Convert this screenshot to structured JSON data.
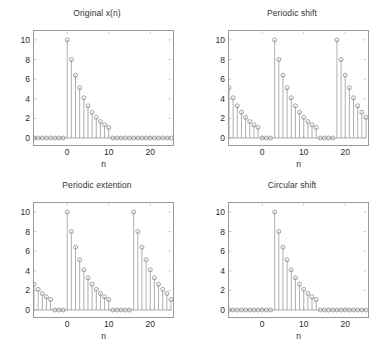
{
  "figure": {
    "width": 389,
    "height": 350,
    "background": "#ffffff",
    "line_color": "#8c8c8c",
    "marker_color": "#8c8c8c",
    "axis_color": "#9a9a9a",
    "text_color": "#2b2b2b",
    "footer_text": ""
  },
  "panels": [
    {
      "id": "original",
      "title": "Original x(n)",
      "xlabel": "n",
      "ylabel": ""
    },
    {
      "id": "periodic-shift",
      "title": "Periodic shift",
      "xlabel": "n",
      "ylabel": ""
    },
    {
      "id": "periodic-extention",
      "title": "Periodic extention",
      "xlabel": "n",
      "ylabel": ""
    },
    {
      "id": "circular-shift",
      "title": "Circular shift",
      "xlabel": "n",
      "ylabel": ""
    }
  ],
  "chart_data": [
    {
      "type": "scatter",
      "plot_style": "stem",
      "title": "Original x(n)",
      "xlabel": "n",
      "ylabel": "",
      "xlim": [
        -8,
        25
      ],
      "ylim": [
        0,
        10.5
      ],
      "xticks": [
        0,
        10,
        20
      ],
      "yticks": [
        0,
        2,
        4,
        6,
        8,
        10
      ],
      "grid": false,
      "legend": "none",
      "x": [
        -8,
        -7,
        -6,
        -5,
        -4,
        -3,
        -2,
        -1,
        0,
        1,
        2,
        3,
        4,
        5,
        6,
        7,
        8,
        9,
        10,
        11,
        12,
        13,
        14,
        15,
        16,
        17,
        18,
        19,
        20,
        21,
        22,
        23,
        24,
        25
      ],
      "values": [
        0,
        0,
        0,
        0,
        0,
        0,
        0,
        0,
        10,
        8,
        6.4,
        5.12,
        4.1,
        3.28,
        2.62,
        2.1,
        1.68,
        1.34,
        1.07,
        0,
        0,
        0,
        0,
        0,
        0,
        0,
        0,
        0,
        0,
        0,
        0,
        0,
        0,
        0
      ]
    },
    {
      "type": "scatter",
      "plot_style": "stem",
      "title": "Periodic shift",
      "xlabel": "n",
      "ylabel": "",
      "xlim": [
        -8,
        25
      ],
      "ylim": [
        0,
        10.5
      ],
      "xticks": [
        0,
        10,
        20
      ],
      "yticks": [
        0,
        2,
        4,
        6,
        8,
        10
      ],
      "grid": false,
      "legend": "none",
      "x": [
        -8,
        -7,
        -6,
        -5,
        -4,
        -3,
        -2,
        -1,
        0,
        1,
        2,
        3,
        4,
        5,
        6,
        7,
        8,
        9,
        10,
        11,
        12,
        13,
        14,
        15,
        16,
        17,
        18,
        19,
        20,
        21,
        22,
        23,
        24,
        25
      ],
      "values": [
        5.12,
        4.1,
        3.28,
        2.62,
        2.1,
        1.68,
        1.34,
        1.07,
        0,
        0,
        0,
        10,
        8,
        6.4,
        5.12,
        4.1,
        3.28,
        2.62,
        2.1,
        1.68,
        1.34,
        1.07,
        0,
        0,
        0,
        0,
        10,
        8,
        6.4,
        5.12,
        4.1,
        3.28,
        2.62,
        2.1
      ]
    },
    {
      "type": "scatter",
      "plot_style": "stem",
      "title": "Periodic extention",
      "xlabel": "n",
      "ylabel": "",
      "xlim": [
        -8,
        25
      ],
      "ylim": [
        0,
        10.5
      ],
      "xticks": [
        0,
        10,
        20
      ],
      "yticks": [
        0,
        2,
        4,
        6,
        8,
        10
      ],
      "grid": false,
      "legend": "none",
      "x": [
        -8,
        -7,
        -6,
        -5,
        -4,
        -3,
        -2,
        -1,
        0,
        1,
        2,
        3,
        4,
        5,
        6,
        7,
        8,
        9,
        10,
        11,
        12,
        13,
        14,
        15,
        16,
        17,
        18,
        19,
        20,
        21,
        22,
        23,
        24,
        25
      ],
      "values": [
        2.62,
        2.1,
        1.68,
        1.34,
        1.07,
        0,
        0,
        0,
        10,
        8,
        6.4,
        5.12,
        4.1,
        3.28,
        2.62,
        2.1,
        1.68,
        1.34,
        1.07,
        0,
        0,
        0,
        0,
        0,
        10,
        8,
        6.4,
        5.12,
        4.1,
        3.28,
        2.62,
        2.1,
        1.68,
        1.07
      ]
    },
    {
      "type": "scatter",
      "plot_style": "stem",
      "title": "Circular shift",
      "xlabel": "n",
      "ylabel": "",
      "xlim": [
        -8,
        25
      ],
      "ylim": [
        0,
        10.5
      ],
      "xticks": [
        0,
        10,
        20
      ],
      "yticks": [
        0,
        2,
        4,
        6,
        8,
        10
      ],
      "grid": false,
      "legend": "none",
      "x": [
        -8,
        -7,
        -6,
        -5,
        -4,
        -3,
        -2,
        -1,
        0,
        1,
        2,
        3,
        4,
        5,
        6,
        7,
        8,
        9,
        10,
        11,
        12,
        13,
        14,
        15,
        16,
        17,
        18,
        19,
        20,
        21,
        22,
        23,
        24,
        25
      ],
      "values": [
        0,
        0,
        0,
        0,
        0,
        0,
        0,
        0,
        0,
        0,
        0,
        10,
        8,
        6.4,
        5.12,
        4.1,
        3.28,
        2.62,
        2.1,
        1.68,
        1.34,
        1.07,
        0,
        0,
        0,
        0,
        0,
        0,
        0,
        0,
        0,
        0,
        0,
        0
      ]
    }
  ]
}
